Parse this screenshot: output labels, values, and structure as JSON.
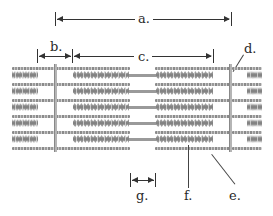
{
  "diagram": {
    "labels": {
      "a": "a.",
      "b": "b.",
      "c": "c.",
      "d": "d.",
      "e": "e.",
      "f": "f.",
      "g": "g."
    },
    "colors": {
      "thin_filament": "#9a9a9a",
      "thick_filament": "#8a8a8a",
      "z_line": "#b5b5b5",
      "annotation": "#333333"
    }
  }
}
